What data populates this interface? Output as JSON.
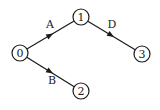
{
  "diagram": {
    "type": "directed-graph",
    "colors": {
      "stroke": "#1a1a1a",
      "fill": "#ffffff",
      "text": "#1a1a1a"
    },
    "node_radius": 8,
    "nodes": [
      {
        "id": "0",
        "label": "0",
        "x": 20,
        "y": 53
      },
      {
        "id": "1",
        "label": "1",
        "x": 81,
        "y": 17
      },
      {
        "id": "2",
        "label": "2",
        "x": 81,
        "y": 91
      },
      {
        "id": "3",
        "label": "3",
        "x": 142,
        "y": 54
      }
    ],
    "edges": [
      {
        "from": "0",
        "to": "1",
        "label": "A",
        "label_x": 50,
        "label_y": 28
      },
      {
        "from": "0",
        "to": "2",
        "label": "B",
        "label_x": 52,
        "label_y": 84
      },
      {
        "from": "1",
        "to": "3",
        "label": "D",
        "label_x": 112,
        "label_y": 28
      }
    ]
  }
}
